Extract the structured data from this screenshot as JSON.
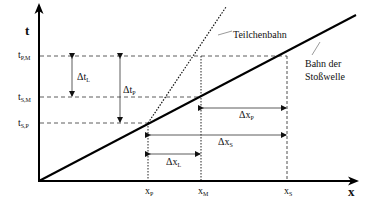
{
  "diagram": {
    "axes": {
      "y_label": "t",
      "x_label": "x"
    },
    "t_labels": [
      {
        "base": "t",
        "sub": "P,M"
      },
      {
        "base": "t",
        "sub": "S,M"
      },
      {
        "base": "t",
        "sub": "S,P"
      }
    ],
    "x_labels": [
      {
        "base": "x",
        "sub": "P"
      },
      {
        "base": "x",
        "sub": "M"
      },
      {
        "base": "x",
        "sub": "S"
      }
    ],
    "deltas": {
      "dt_L": {
        "base": "Δt",
        "sub": "L"
      },
      "dt_P": {
        "base": "Δt",
        "sub": "P"
      },
      "dx_P": {
        "base": "Δx",
        "sub": "P"
      },
      "dx_S": {
        "base": "Δx",
        "sub": "S"
      },
      "dx_L": {
        "base": "Δx",
        "sub": "L"
      }
    },
    "annotations": {
      "particle_path": "Teilchenbahn",
      "shock_path_line1": "Bahn der",
      "shock_path_line2": "Stoßwelle"
    }
  }
}
